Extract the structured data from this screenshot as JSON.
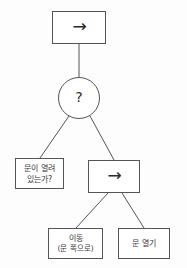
{
  "diagram": {
    "type": "behavior-tree",
    "stroke_color": "#555555",
    "text_color": "#3a3a3a",
    "background_color": "#fdfdfd",
    "nodes": [
      {
        "id": "root-sequence",
        "shape": "rectangle",
        "glyph": "→",
        "glyph_name": "right-arrow-icon",
        "role": "sequence",
        "label": ""
      },
      {
        "id": "selector",
        "shape": "circle",
        "glyph": "?",
        "glyph_name": "question-mark-icon",
        "role": "selector",
        "label": ""
      },
      {
        "id": "condition-door-open",
        "shape": "rectangle",
        "role": "condition",
        "line1": "문이 열려",
        "line2": "있는가?"
      },
      {
        "id": "sequence-open-door",
        "shape": "rectangle",
        "glyph": "→",
        "glyph_name": "right-arrow-icon",
        "role": "sequence",
        "label": ""
      },
      {
        "id": "action-move",
        "shape": "rectangle",
        "role": "action",
        "line1": "이동",
        "line2": "(문 쪽으로)"
      },
      {
        "id": "action-open-door",
        "shape": "rectangle",
        "role": "action",
        "line1": "문 열기",
        "line2": ""
      }
    ],
    "edges": [
      {
        "from": "root-sequence",
        "to": "selector",
        "style": "vertical"
      },
      {
        "from": "selector",
        "to": "condition-door-open",
        "style": "diagonal"
      },
      {
        "from": "selector",
        "to": "sequence-open-door",
        "style": "diagonal"
      },
      {
        "from": "sequence-open-door",
        "to": "action-move",
        "style": "diagonal"
      },
      {
        "from": "sequence-open-door",
        "to": "action-open-door",
        "style": "diagonal"
      }
    ]
  }
}
